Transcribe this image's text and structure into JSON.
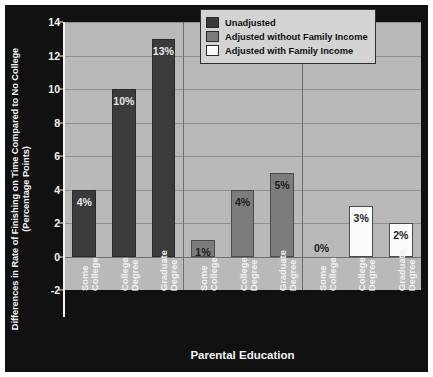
{
  "chart_data": {
    "type": "bar",
    "title": "",
    "xlabel": "Parental Education",
    "ylabel_line1": "Differences in Rate of Finishing on Time Compared to No College",
    "ylabel_line2": "(Percentage Points)",
    "ylim": [
      -2,
      14
    ],
    "yticks": [
      -2,
      0,
      2,
      4,
      6,
      8,
      10,
      12,
      14
    ],
    "ytick_labels": [
      "-2",
      "0",
      "2",
      "4",
      "6",
      "8",
      "10",
      "12",
      "14"
    ],
    "grid": true,
    "legend_position": "top-right",
    "categories": [
      "Some College",
      "College Degree",
      "Graduate Degree"
    ],
    "group_labels": [
      "Unadjusted",
      "Adjusted without Family Income",
      "Adjusted with Family Income"
    ],
    "series": [
      {
        "name": "Unadjusted",
        "color": "#3b3b3b",
        "values": [
          4,
          10,
          13
        ],
        "value_labels": [
          "4%",
          "10%",
          "13%"
        ]
      },
      {
        "name": "Adjusted without Family Income",
        "color": "#7c7c7c",
        "values": [
          1,
          4,
          5
        ],
        "value_labels": [
          "1%",
          "4%",
          "5%"
        ]
      },
      {
        "name": "Adjusted with Family Income",
        "color": "#fbfbfb",
        "values": [
          0,
          3,
          2
        ],
        "value_labels": [
          "0%",
          "3%",
          "2%"
        ]
      }
    ]
  },
  "legend": {
    "items": [
      {
        "label": "Unadjusted",
        "color": "#3b3b3b"
      },
      {
        "label": "Adjusted without Family Income",
        "color": "#7c7c7c"
      },
      {
        "label": "Adjusted with Family Income",
        "color": "#fbfbfb"
      }
    ]
  },
  "xtick_labels": [
    {
      "line1": "Some",
      "line2": "College"
    },
    {
      "line1": "College",
      "line2": "Degree"
    },
    {
      "line1": "Graduate",
      "line2": "Degree"
    },
    {
      "line1": "Some",
      "line2": "College"
    },
    {
      "line1": "College",
      "line2": "Degree"
    },
    {
      "line1": "Graduate",
      "line2": "Degree"
    },
    {
      "line1": "Some",
      "line2": "College"
    },
    {
      "line1": "College",
      "line2": "Degree"
    },
    {
      "line1": "Graduate",
      "line2": "Degree"
    }
  ]
}
